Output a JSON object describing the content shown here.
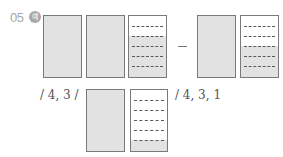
{
  "problem": {
    "number": "05",
    "badge": "예"
  },
  "row1": {
    "operator": "−",
    "left_group": [
      {
        "type": "full",
        "shaded_parts": 6,
        "total_parts": 6
      },
      {
        "type": "full",
        "shaded_parts": 6,
        "total_parts": 6
      },
      {
        "type": "partial",
        "shaded_parts": 4,
        "total_parts": 6
      }
    ],
    "right_group": [
      {
        "type": "full",
        "shaded_parts": 6,
        "total_parts": 6
      },
      {
        "type": "partial",
        "shaded_parts": 3,
        "total_parts": 6
      }
    ]
  },
  "row2": {
    "answer_left": "/ 4, 3 /",
    "answer_right": "/ 4, 3, 1",
    "result_group": [
      {
        "type": "full",
        "shaded_parts": 6,
        "total_parts": 6
      },
      {
        "type": "partial",
        "shaded_parts": 1,
        "total_parts": 6
      }
    ]
  },
  "colors": {
    "shade": "#e2e2e2",
    "border": "#7a7a7a",
    "label": "#a8a8a8"
  }
}
